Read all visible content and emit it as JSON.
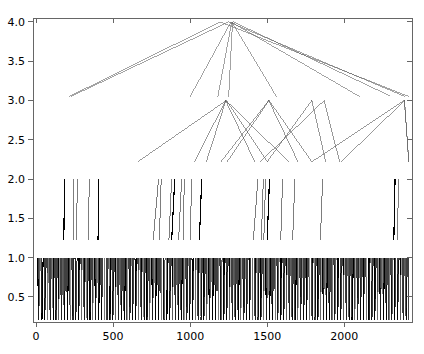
{
  "chart_data": {
    "type": "line",
    "title": "",
    "subtitle": "",
    "xlabel": "",
    "ylabel": "",
    "xlim": [
      -20,
      2440
    ],
    "ylim": [
      0.18,
      4.05
    ],
    "grid": false,
    "legend": null,
    "xticks": [
      0,
      500,
      1000,
      1500,
      2000
    ],
    "xtick_labels": [
      "0",
      "500",
      "1000",
      "1500",
      "2000"
    ],
    "yticks": [
      0.5,
      1.0,
      1.5,
      2.0,
      2.5,
      3.0,
      3.5,
      4.0
    ],
    "ytick_labels": [
      "0.5",
      "1.0",
      "1.5",
      "2.0",
      "2.5",
      "3.0",
      "3.5",
      "4.0"
    ],
    "levels": [
      {
        "name": "level-1",
        "y_top": 1.0,
        "y_bottom": 0.2,
        "stroke": "#000000",
        "stroke_width": 0.8,
        "x_starts": [
          10,
          18,
          24,
          31,
          38,
          46,
          53,
          60,
          66,
          72,
          79,
          85,
          92,
          99,
          106,
          112,
          119,
          126,
          132,
          139,
          146,
          152,
          158,
          165,
          172,
          178,
          185,
          192,
          199,
          205,
          212,
          219,
          226,
          232,
          239,
          246,
          253,
          259,
          266,
          272,
          279,
          286,
          293,
          299,
          306,
          313,
          320,
          326,
          333,
          340,
          347,
          353,
          360,
          366,
          373,
          380,
          387,
          393,
          400,
          407,
          414,
          420,
          427,
          434,
          441,
          447,
          454,
          461,
          468,
          474,
          481,
          488,
          494,
          501,
          508,
          514,
          521,
          528,
          535,
          541,
          548,
          555,
          562,
          568,
          575,
          582,
          588,
          595,
          602,
          609,
          615,
          622,
          629,
          635,
          642,
          649,
          656,
          662,
          669,
          676,
          683,
          689,
          696,
          703,
          709,
          716,
          723,
          730,
          736,
          743,
          750,
          756,
          763,
          770,
          777,
          783,
          790,
          797,
          803,
          810,
          817,
          824,
          830,
          837,
          844,
          851,
          857,
          864,
          871,
          877,
          884,
          891,
          898,
          904,
          911,
          918,
          924,
          931,
          938,
          945,
          951,
          958,
          965,
          971,
          978,
          985,
          992,
          998,
          1005,
          1012,
          1019,
          1025,
          1032,
          1039,
          1045,
          1052,
          1059,
          1066,
          1072,
          1079,
          1086,
          1092,
          1099,
          1106,
          1113,
          1119,
          1126,
          1133,
          1140,
          1146,
          1153,
          1160,
          1166,
          1173,
          1180,
          1187,
          1193,
          1200,
          1207,
          1213,
          1220,
          1227,
          1234,
          1240,
          1247,
          1254,
          1261,
          1267,
          1274,
          1281,
          1287,
          1294,
          1301,
          1308,
          1314,
          1321,
          1328,
          1334,
          1341,
          1348,
          1355,
          1361,
          1368,
          1375,
          1382,
          1388,
          1395,
          1402,
          1408,
          1415,
          1422,
          1429,
          1435,
          1442,
          1449,
          1455,
          1462,
          1469,
          1476,
          1482,
          1489,
          1496,
          1503,
          1509,
          1516,
          1523,
          1529,
          1536,
          1543,
          1550,
          1556,
          1563,
          1570,
          1576,
          1583,
          1590,
          1597,
          1603,
          1610,
          1617,
          1624,
          1630,
          1637,
          1644,
          1650,
          1657,
          1664,
          1671,
          1677,
          1684,
          1691,
          1697,
          1704,
          1711,
          1718,
          1724,
          1731,
          1738,
          1745,
          1751,
          1758,
          1765,
          1771,
          1778,
          1785,
          1792,
          1798,
          1805,
          1812,
          1818,
          1825,
          1832,
          1839,
          1845,
          1852,
          1859,
          1866,
          1872,
          1879,
          1886,
          1892,
          1899,
          1906,
          1913,
          1919,
          1926,
          1933,
          1939,
          1946,
          1953,
          1960,
          1966,
          1973,
          1980,
          1987,
          1993,
          2000,
          2007,
          2013,
          2020,
          2027,
          2034,
          2040,
          2047,
          2054,
          2060,
          2067,
          2074,
          2081,
          2087,
          2094,
          2101,
          2108,
          2114,
          2121,
          2128,
          2134,
          2141,
          2148,
          2155,
          2161,
          2168,
          2175,
          2181,
          2188,
          2195,
          2202,
          2208,
          2215,
          2222,
          2229,
          2235,
          2242,
          2249,
          2255,
          2262,
          2269,
          2276,
          2282,
          2289,
          2296,
          2302,
          2309,
          2316,
          2323,
          2329,
          2336,
          2343,
          2350,
          2356,
          2363,
          2370,
          2376,
          2383,
          2390,
          2397,
          2403,
          2410,
          2417
        ]
      },
      {
        "name": "level-2",
        "y_top": 2.0,
        "y_bottom": 1.22,
        "stroke": "#000000",
        "stroke_width": 0.8,
        "segments": [
          {
            "x1": 185,
            "x2": 180
          },
          {
            "x1": 245,
            "x2": 240
          },
          {
            "x1": 268,
            "x2": 262
          },
          {
            "x1": 345,
            "x2": 340
          },
          {
            "x1": 408,
            "x2": 402
          },
          {
            "x1": 795,
            "x2": 760
          },
          {
            "x1": 812,
            "x2": 800
          },
          {
            "x1": 880,
            "x2": 862
          },
          {
            "x1": 900,
            "x2": 880
          },
          {
            "x1": 945,
            "x2": 925
          },
          {
            "x1": 962,
            "x2": 955
          },
          {
            "x1": 1010,
            "x2": 1000
          },
          {
            "x1": 1075,
            "x2": 1060
          },
          {
            "x1": 1440,
            "x2": 1410
          },
          {
            "x1": 1475,
            "x2": 1462
          },
          {
            "x1": 1490,
            "x2": 1478
          },
          {
            "x1": 1515,
            "x2": 1500
          },
          {
            "x1": 1600,
            "x2": 1588
          },
          {
            "x1": 1680,
            "x2": 1665
          },
          {
            "x1": 1860,
            "x2": 1845
          },
          {
            "x1": 2330,
            "x2": 2322
          },
          {
            "x1": 2352,
            "x2": 2346
          }
        ]
      },
      {
        "name": "level-3",
        "y_apex": 3.0,
        "y_base": 2.22,
        "stroke": "#555555",
        "stroke_width": 0.7,
        "peaks": [
          {
            "apex_x": 1235,
            "left_x": 660,
            "right_x": 1500
          },
          {
            "apex_x": 1230,
            "left_x": 1030,
            "right_x": 1420
          },
          {
            "apex_x": 1232,
            "left_x": 1105,
            "right_x": 1640
          },
          {
            "apex_x": 1510,
            "left_x": 1200,
            "right_x": 1700
          },
          {
            "apex_x": 1512,
            "left_x": 1240,
            "right_x": 1790
          },
          {
            "apex_x": 1790,
            "left_x": 1500,
            "right_x": 1880
          },
          {
            "apex_x": 1870,
            "left_x": 1455,
            "right_x": 1970
          },
          {
            "apex_x": 2390,
            "left_x": 1790,
            "right_x": 2420
          },
          {
            "apex_x": 2392,
            "left_x": 1980,
            "right_x": 2418
          }
        ]
      },
      {
        "name": "level-4",
        "y_apex": 4.0,
        "y_base": 3.05,
        "stroke": "#666666",
        "stroke_width": 0.7,
        "peaks": [
          {
            "apex_x": 1195,
            "left_x": 215,
            "right_x": 2420
          },
          {
            "apex_x": 1250,
            "left_x": 225,
            "right_x": 2395
          },
          {
            "apex_x": 1265,
            "left_x": 1000,
            "right_x": 2100
          },
          {
            "apex_x": 1270,
            "left_x": 1180,
            "right_x": 1560
          },
          {
            "apex_x": 1275,
            "left_x": 1250,
            "right_x": 2300
          }
        ]
      }
    ]
  },
  "axis": {
    "frame_color": "#666666",
    "tick_color": "#666666",
    "label_color": "#000000"
  }
}
